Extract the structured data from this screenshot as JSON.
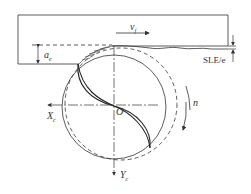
{
  "diagram": {
    "type": "milling cutter cross-section schematic",
    "labels": {
      "feed_velocity": "v",
      "feed_velocity_sub": "f",
      "depth_of_cut": "a",
      "depth_of_cut_sub": "e",
      "surface_error": "SLE/e",
      "rotation": "n",
      "origin": "O",
      "x_axis": "X",
      "x_axis_sub": "c",
      "y_axis": "Y",
      "y_axis_sub": "c"
    },
    "colors": {
      "line": "#333333",
      "background": "#ffffff"
    }
  }
}
